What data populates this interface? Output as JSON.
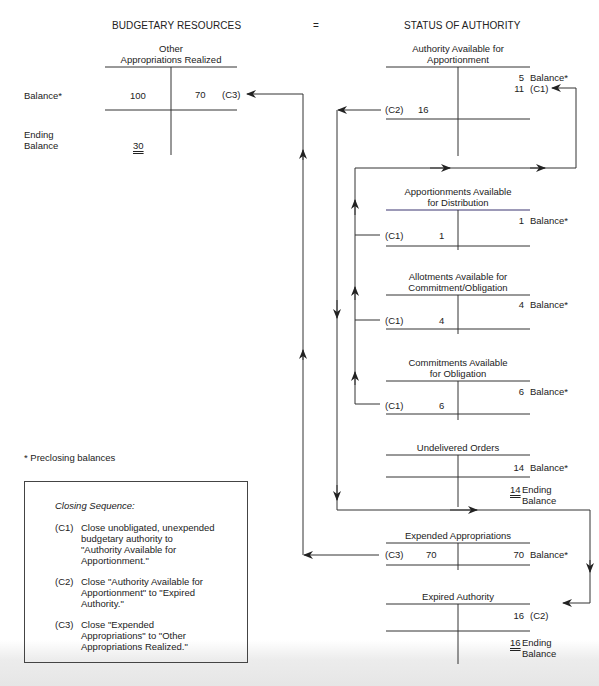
{
  "header": {
    "left_title": "BUDGETARY RESOURCES",
    "equals": "=",
    "right_title": "STATUS OF AUTHORITY"
  },
  "budgetary": {
    "account": {
      "title_line1": "Other",
      "title_line2": "Appropriations Realized",
      "row_label": "Balance*",
      "debit": "100",
      "credit": "70",
      "credit_ref": "(C3)",
      "ending_label_line1": "Ending",
      "ending_label_line2": "Balance",
      "ending_value": "30"
    }
  },
  "status": {
    "accounts": [
      {
        "title_line1": "Authority Available for",
        "title_line2": "Apportionment",
        "credit_1": "5",
        "credit_1_label": "Balance*",
        "credit_2": "11",
        "credit_2_label": "(C1)",
        "debit_ref": "(C2)",
        "debit": "16"
      },
      {
        "title_line1": "Apportionments Available",
        "title_line2": "for Distribution",
        "credit": "1",
        "credit_label": "Balance*",
        "debit_ref": "(C1)",
        "debit": "1"
      },
      {
        "title_line1": "Allotments Available for",
        "title_line2": "Commitment/Obligation",
        "credit": "4",
        "credit_label": "Balance*",
        "debit_ref": "(C1)",
        "debit": "4"
      },
      {
        "title_line1": "Commitments Available",
        "title_line2": "for Obligation",
        "credit": "6",
        "credit_label": "Balance*",
        "debit_ref": "(C1)",
        "debit": "6"
      },
      {
        "title_line1": "Undelivered Orders",
        "credit": "14",
        "credit_label": "Balance*",
        "ending_value": "14",
        "ending_label_line1": "Ending",
        "ending_label_line2": "Balance"
      },
      {
        "title_line1": "Expended Appropriations",
        "debit_ref": "(C3)",
        "debit": "70",
        "credit": "70",
        "credit_label": "Balance*"
      },
      {
        "title_line1": "Expired Authority",
        "credit": "16",
        "credit_label": "(C2)",
        "ending_value": "16",
        "ending_label_line1": "Ending",
        "ending_label_line2": "Balance"
      }
    ]
  },
  "footnote": "* Preclosing balances",
  "closing_sequence": {
    "title": "Closing Sequence:",
    "steps": [
      {
        "code": "(C1)",
        "lines": [
          "Close unobligated, unexpended",
          "budgetary authority to",
          "\"Authority Available for",
          "Apportionment.\""
        ]
      },
      {
        "code": "(C2)",
        "lines": [
          "Close \"Authority Available for",
          "Apportionment\" to \"Expired",
          "Authority.\""
        ]
      },
      {
        "code": "(C3)",
        "lines": [
          "Close \"Expended",
          "Appropriations\" to \"Other",
          "Appropriations Realized.\""
        ]
      }
    ]
  },
  "colors": {
    "line": "#333333",
    "text": "#222222"
  }
}
